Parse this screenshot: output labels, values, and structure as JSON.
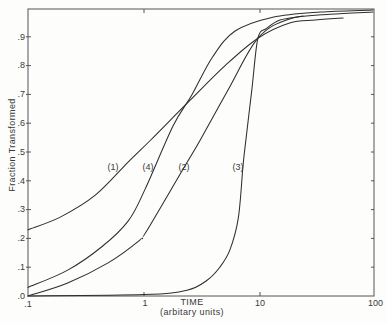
{
  "chart_data": {
    "type": "line",
    "title": "",
    "xlabel": "TIME",
    "xlabel_sub": "(arbitary units)",
    "ylabel": "Fraction  Transformed",
    "xscale": "log",
    "xlim": [
      0.1,
      100
    ],
    "ylim": [
      0,
      1.0
    ],
    "grid": false,
    "legend": "none (curves labelled inline)",
    "x_tick_labels": [
      ".1",
      "1",
      "10",
      "100"
    ],
    "x_ticks": [
      0.1,
      1,
      10,
      100
    ],
    "y_tick_labels": [
      ".0",
      ".1",
      ".2",
      ".3",
      ".4",
      ".5",
      ".6",
      ".7",
      ".8",
      ".9"
    ],
    "y_ticks": [
      0,
      0.1,
      0.2,
      0.3,
      0.4,
      0.5,
      0.6,
      0.7,
      0.8,
      0.9
    ],
    "series": [
      {
        "name": "curve-1",
        "label": "(1)",
        "x": [
          0.1,
          0.19,
          0.38,
          0.73,
          1.13,
          2.5,
          5.0,
          9.6,
          18,
          30,
          52
        ],
        "y": [
          0.23,
          0.274,
          0.35,
          0.465,
          0.54,
          0.68,
          0.8,
          0.895,
          0.948,
          0.958,
          0.965
        ]
      },
      {
        "name": "curve-2",
        "label": "(2)",
        "x": [
          0.1,
          0.22,
          0.49,
          0.92,
          1.04,
          2.17,
          3.04,
          5.3,
          9.6,
          18,
          40,
          94
        ],
        "y": [
          0.0,
          0.045,
          0.115,
          0.194,
          0.222,
          0.44,
          0.54,
          0.715,
          0.895,
          0.962,
          0.978,
          0.986
        ]
      },
      {
        "name": "curve-3",
        "label": "(3)",
        "x": [
          0.1,
          1.0,
          2.35,
          3.5,
          4.5,
          5.5,
          6.5,
          7.1,
          7.4,
          8.5,
          9.6,
          11.4,
          14.9,
          22,
          23.5
        ],
        "y": [
          0.0,
          0.005,
          0.02,
          0.055,
          0.1,
          0.16,
          0.27,
          0.44,
          0.51,
          0.715,
          0.895,
          0.929,
          0.958,
          0.97,
          0.972
        ]
      },
      {
        "name": "curve-4",
        "label": "(4)",
        "x": [
          0.1,
          0.22,
          0.43,
          0.73,
          1.02,
          1.78,
          2.6,
          3.9,
          6.1,
          12.9,
          33,
          94
        ],
        "y": [
          0.03,
          0.09,
          0.17,
          0.26,
          0.37,
          0.59,
          0.7,
          0.83,
          0.92,
          0.968,
          0.986,
          0.993
        ]
      }
    ],
    "annotations": [
      "(1)",
      "(4)",
      "(2)",
      "(3)"
    ],
    "colors": {
      "line": "#2e2e2e",
      "axis": "#555555",
      "background": "#fdfdfc"
    }
  }
}
